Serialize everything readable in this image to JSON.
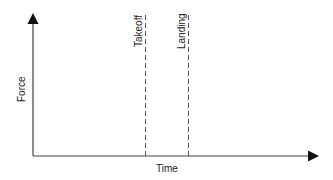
{
  "diagram": {
    "type": "axes-schematic",
    "y_axis": {
      "label": "Force"
    },
    "x_axis": {
      "label": "Time"
    },
    "markers": [
      {
        "label": "Takeoff",
        "style": "dashed"
      },
      {
        "label": "Landing",
        "style": "dashed"
      }
    ],
    "colors": {
      "line": "#333333",
      "text": "#222222",
      "background": "#ffffff"
    }
  }
}
